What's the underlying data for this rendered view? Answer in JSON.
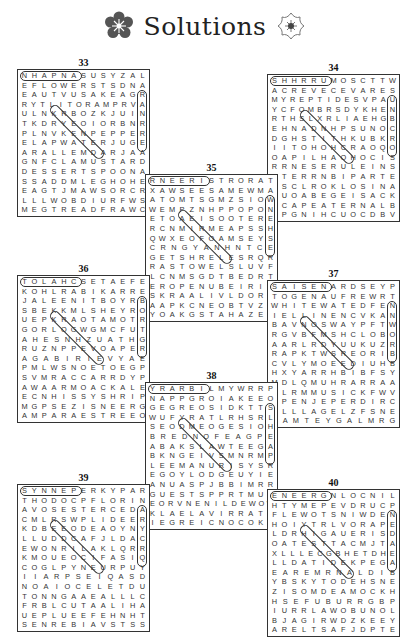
{
  "header": {
    "title": "Solutions",
    "left_icon": "flower-badge-icon",
    "right_icon": "flower-outline-icon"
  },
  "puzzles": [
    {
      "number": "33",
      "rows": [
        "NHAPNASUSYZAL",
        "EFLOWERSTSDNA",
        "EAUTVUSAKEAGR",
        "RYTLITORAMPRVA",
        "ULNKRBOZKJUIN",
        "TKDRYEOIORBNR",
        "PLNVKENPEPPER",
        "ELAPWATERJUGE",
        "ARALLEMDARJAA",
        "GNFCLAMUSTARD",
        "DESSERTSPOONA",
        "SSADDMLEGHOHE",
        "EAGTJMAWSORCR",
        "LLLWOBDIURFWS",
        "MEGTREADFRAWC"
      ]
    },
    {
      "number": "34",
      "rows": [
        "SHHRRUMOSCTTW",
        "ACREVECEVARES",
        "MYREPTIDESVPAU",
        "YCFOMBRSDYKHEN",
        "RTHSLXRLIAEHGB",
        "EHNADNHPSUNOC",
        "DGHSTITHKUBKR",
        "IITOHOHCRAOQO",
        "OAPILHAOHOCIS",
        "RRNESERULEINS",
        "BTERRNBIPARTE",
        "MSCLROKLOSINA",
        "EUOABEGEISACK",
        "PCAPEATERNALB",
        "KPGNIHCUOCDBV"
      ]
    },
    {
      "number": "35",
      "rows": [
        "RNEERISTRORAT",
        "XAWSEESAMEWMA",
        "ATOMTSGMZSIOW",
        "WEMPZNHPPOPON",
        "ETOAEISOOTERE",
        "RCNMIRMEAPSSH",
        "QWXEOFOAMSEYS",
        "CRNGYANHNTCE",
        "GETSHRELESRQR",
        "RASTOWELSLUVF",
        "LCNMSGDTBEDRT",
        "EROPENUBEIRIS",
        "SKRAALIVLDORE",
        "AAPKCNEOBTVZM",
        "YOAKGSTAHAZEI"
      ]
    },
    {
      "number": "36",
      "rows": [
        "TOLAHCSETAEFE",
        "KOHLRABIKARRE",
        "JALEENITBOYRB",
        "SBEKKMLSHEYRO",
        "UEPKRAOTAMOTR",
        "GORLOGWGMCFUT",
        "AHESNHZUATHG",
        "RUZNPPEVOAPER",
        "AGABIRIEVYAE",
        "PMLWSNOETOEGP",
        "SVMRACCARRDYP",
        "AWAARMOACKALE",
        "ECNHISSYSHRIP",
        "MGPSEZISNEERG",
        "AMPARAESTREEO"
      ]
    },
    {
      "number": "37",
      "rows": [
        "SAISENARDSEYP",
        "TOGENAUFREWRT",
        "WHITEWATEDFEN",
        "IELLINENCVKAN",
        "BAVNOSWAYPFTW",
        "RGVBFMSHCLOBO",
        "AARLRDYUUKUZR",
        "RAPKTWSREORIB",
        "CVLYMOEEDIUHB",
        "HXYARRHBIBFSY",
        "MDLQMUHRARRAA",
        "ELRMMUSICKFWV",
        "NPENJEPERDIRC",
        "TLLLAGELZFSNE",
        "LAMTEYGALMRG"
      ]
    },
    {
      "number": "38",
      "rows": [
        "YRARBILMYWRRP",
        "NAPPGROIAKEEO",
        "GEGREOSIDKTTS",
        "WUFYRATLRHSRL",
        "SEODMEOGESIOH",
        "BREDNOFEAGPE",
        "ABAKSLAWTEEGA",
        "BKNGEIVSMNRMP",
        "LEEMANURISYSR",
        "EGOYLODGEUYIE",
        "ANUASPJBBIMRR",
        "GUESTSPPRTMUA",
        "EORVNENILDEWOW",
        "KLAELAVIRRATS",
        "IEGREICNOCOKH"
      ]
    },
    {
      "number": "39",
      "rows": [
        "SYNNEPERKYPAR",
        "THODOCPFLORIN",
        "AVOSESTERCEDA",
        "CMLRSWPLIDEER",
        "KDBEEODEAOYNY",
        "LLUDDCAFJLDAC",
        "EWONRILAKLQRR",
        "KMOUEOCIFASIQ",
        "COGLPYNEURPUY",
        "IIARPSEIQASD",
        "NOAIOCELETDU",
        "TONNGAAEALLLC",
        "FRBLCUTAALIHA",
        "UEPLUEEFEHNHT",
        "SENREBIAVSTSS"
      ]
    },
    {
      "number": "40",
      "rows": [
        "ENEERGNLOCNIL",
        "HTYMEPEVDRUCP",
        "FLEWOTSNIWDEN",
        "HOIYTRLVORAPE",
        "LDRHIGAUERISD",
        "OATESTTACMJTA",
        "XLLLECGBHETDHE",
        "LLDATIDEKPEGA",
        "EAREMRNALDIB",
        "YBSKYTODEHSNE",
        "ZISOMDEAMOCKH",
        "HSEFUBURRGBP",
        "IURRLAWOBUNOL",
        "BJAGIRWDZKEEY",
        "ARELTSAFJDPTE"
      ]
    }
  ]
}
